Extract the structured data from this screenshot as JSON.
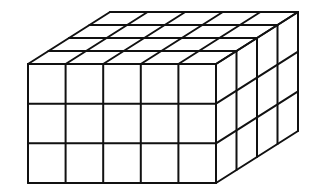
{
  "diagram": {
    "title": "Rectangular prism built from unit cubes",
    "type": "isometric-cube-stack",
    "dimensions": {
      "width_cubes": 5,
      "depth_cubes": 4,
      "height_cubes": 3
    },
    "total_cubes": 60,
    "colors": {
      "stroke": "#111111",
      "fill": "#ffffff"
    },
    "geometry": {
      "front_left": 28,
      "front_top": 64,
      "front_right": 216,
      "front_bottom": 183,
      "depth_dx": 82,
      "depth_dy": -52
    }
  }
}
